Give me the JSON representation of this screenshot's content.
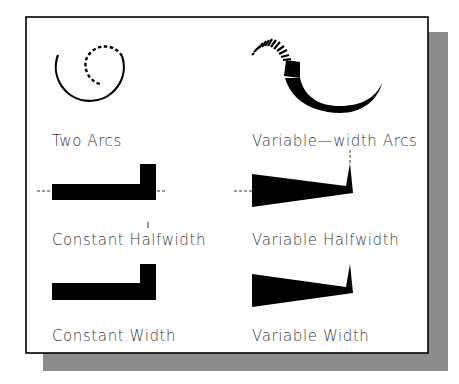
{
  "figure": {
    "panels": [
      {
        "id": "two-arcs",
        "label": "Two Arcs"
      },
      {
        "id": "variable-width-arcs",
        "label": "Variable—width Arcs"
      },
      {
        "id": "constant-halfwidth",
        "label": "Constant Halfwidth"
      },
      {
        "id": "variable-halfwidth",
        "label": "Variable Halfwidth"
      },
      {
        "id": "constant-width",
        "label": "Constant Width"
      },
      {
        "id": "variable-width",
        "label": "Variable Width"
      }
    ]
  },
  "colors": {
    "ink": "#000000",
    "text": "#3a3a3a",
    "shadow": "#8c8c8c",
    "paper": "#ffffff"
  }
}
